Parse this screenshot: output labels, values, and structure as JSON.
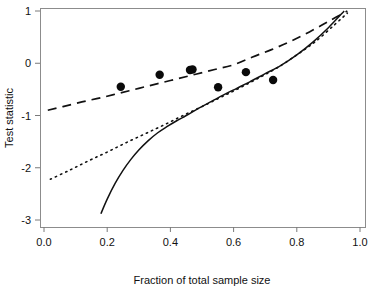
{
  "chart_data": {
    "type": "scatter",
    "title": "",
    "xlabel": "Fraction of total sample size",
    "ylabel": "Test statistic",
    "xlim": [
      0.0,
      1.0
    ],
    "ylim": [
      -3.0,
      1.0
    ],
    "xticks": [
      "0.0",
      "0.2",
      "0.4",
      "0.6",
      "0.8",
      "1.0"
    ],
    "xtick_values": [
      0.0,
      0.2,
      0.4,
      0.6,
      0.8,
      1.0
    ],
    "yticks": [
      "1",
      "0",
      "-1",
      "-2",
      "-3"
    ],
    "ytick_values": [
      1,
      0,
      -1,
      -2,
      -3
    ],
    "grid": false,
    "legend": "none",
    "points": {
      "name": "Observed test statistic",
      "marker": "filled-circle",
      "x": [
        0.243,
        0.366,
        0.462,
        0.47,
        0.551,
        0.639,
        0.725
      ],
      "y": [
        -0.45,
        -0.22,
        -0.13,
        -0.12,
        -0.46,
        -0.17,
        -0.32
      ]
    },
    "series": [
      {
        "name": "Upper boundary",
        "style": "dashed",
        "x": [
          0.012,
          0.06,
          0.12,
          0.18,
          0.24,
          0.3,
          0.36,
          0.42,
          0.48,
          0.54,
          0.6,
          0.66,
          0.72,
          0.78,
          0.84,
          0.9,
          0.96
        ],
        "y": [
          -0.9,
          -0.83,
          -0.74,
          -0.66,
          -0.57,
          -0.48,
          -0.39,
          -0.3,
          -0.21,
          -0.12,
          -0.03,
          0.12,
          0.26,
          0.42,
          0.6,
          0.8,
          1.0
        ]
      },
      {
        "name": "Lower boundary",
        "style": "dotted",
        "x": [
          0.02,
          0.08,
          0.14,
          0.2,
          0.26,
          0.32,
          0.38,
          0.44,
          0.5,
          0.56,
          0.62,
          0.68,
          0.74,
          0.8,
          0.86,
          0.92,
          0.96
        ],
        "y": [
          -2.22,
          -2.05,
          -1.87,
          -1.7,
          -1.52,
          -1.35,
          -1.18,
          -1.0,
          -0.83,
          -0.65,
          -0.47,
          -0.28,
          -0.08,
          0.16,
          0.42,
          0.74,
          0.96
        ]
      },
      {
        "name": "Fitted curve",
        "style": "solid",
        "x": [
          0.18,
          0.2,
          0.225,
          0.25,
          0.275,
          0.3,
          0.33,
          0.36,
          0.39,
          0.42,
          0.45,
          0.49,
          0.53,
          0.57,
          0.61,
          0.65,
          0.7,
          0.75,
          0.8,
          0.85,
          0.9,
          0.95
        ],
        "y": [
          -2.88,
          -2.6,
          -2.3,
          -2.05,
          -1.84,
          -1.66,
          -1.48,
          -1.33,
          -1.21,
          -1.1,
          -1.0,
          -0.86,
          -0.73,
          -0.6,
          -0.48,
          -0.36,
          -0.2,
          -0.04,
          0.16,
          0.4,
          0.68,
          1.0
        ]
      }
    ]
  }
}
